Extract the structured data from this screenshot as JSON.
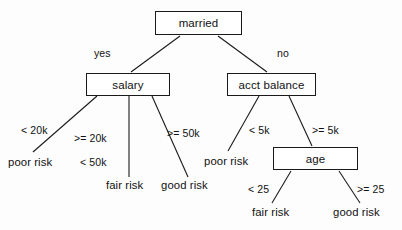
{
  "diagram": {
    "type": "decision-tree",
    "title": "",
    "nodes": [
      {
        "id": "married",
        "label": "married",
        "x": 155,
        "y": 11,
        "w": 87,
        "h": 24
      },
      {
        "id": "salary",
        "label": "salary",
        "x": 86,
        "y": 73,
        "w": 84,
        "h": 23
      },
      {
        "id": "acct_balance",
        "label": "acct balance",
        "x": 227,
        "y": 73,
        "w": 89,
        "h": 23
      },
      {
        "id": "age",
        "label": "age",
        "x": 273,
        "y": 147,
        "w": 85,
        "h": 23
      }
    ],
    "leaves": [
      {
        "id": "leaf-poor-risk-salary",
        "label": "poor risk",
        "x": 8,
        "y": 156
      },
      {
        "id": "leaf-fair-risk-salary",
        "label": "fair risk",
        "x": 106,
        "y": 179
      },
      {
        "id": "leaf-good-risk-salary",
        "label": "good risk",
        "x": 161,
        "y": 179
      },
      {
        "id": "leaf-poor-risk-acct",
        "label": "poor risk",
        "x": 204,
        "y": 155
      },
      {
        "id": "leaf-fair-risk-age",
        "label": "fair risk",
        "x": 252,
        "y": 206
      },
      {
        "id": "leaf-good-risk-age",
        "label": "good risk",
        "x": 333,
        "y": 206
      }
    ],
    "edge_labels": [
      {
        "id": "edge-label-yes",
        "label": "yes",
        "x": 94,
        "y": 47
      },
      {
        "id": "edge-label-no",
        "label": "no",
        "x": 277,
        "y": 47
      },
      {
        "id": "edge-label-lt-20k",
        "label": "< 20k",
        "x": 21,
        "y": 124
      },
      {
        "id": "edge-label-gte-20k",
        "label": ">= 20k",
        "x": 74,
        "y": 132
      },
      {
        "id": "edge-label-lt-50k",
        "label": "< 50k",
        "x": 80,
        "y": 156
      },
      {
        "id": "edge-label-gte-50k",
        "label": ">= 50k",
        "x": 167,
        "y": 127
      },
      {
        "id": "edge-label-lt-5k",
        "label": "< 5k",
        "x": 249,
        "y": 124
      },
      {
        "id": "edge-label-gte-5k",
        "label": ">= 5k",
        "x": 312,
        "y": 124
      },
      {
        "id": "edge-label-lt-25",
        "label": "< 25",
        "x": 248,
        "y": 183
      },
      {
        "id": "edge-label-gte-25",
        "label": ">= 25",
        "x": 357,
        "y": 183
      }
    ],
    "edges": [
      {
        "id": "edge-married-salary",
        "from": "married",
        "to": "salary",
        "condition": "yes",
        "x1": 180,
        "y1": 36,
        "x2": 131,
        "y2": 72
      },
      {
        "id": "edge-married-acct",
        "from": "married",
        "to": "acct_balance",
        "condition": "no",
        "x1": 218,
        "y1": 36,
        "x2": 267,
        "y2": 72
      },
      {
        "id": "edge-salary-poor",
        "from": "salary",
        "to": "leaf-poor-risk-salary",
        "condition": "< 20k",
        "x1": 97,
        "y1": 96,
        "x2": 33,
        "y2": 152
      },
      {
        "id": "edge-salary-fair",
        "from": "salary",
        "to": "leaf-fair-risk-salary",
        "condition": ">= 20k, < 50k",
        "x1": 129,
        "y1": 96,
        "x2": 129,
        "y2": 177
      },
      {
        "id": "edge-salary-good",
        "from": "salary",
        "to": "leaf-good-risk-salary",
        "condition": ">= 50k",
        "x1": 152,
        "y1": 96,
        "x2": 188,
        "y2": 177
      },
      {
        "id": "edge-acct-poor",
        "from": "acct_balance",
        "to": "leaf-poor-risk-acct",
        "condition": "< 5k",
        "x1": 259,
        "y1": 96,
        "x2": 228,
        "y2": 151
      },
      {
        "id": "edge-acct-age",
        "from": "acct_balance",
        "to": "age",
        "condition": ">= 5k",
        "x1": 289,
        "y1": 96,
        "x2": 312,
        "y2": 146
      },
      {
        "id": "edge-age-fair",
        "from": "age",
        "to": "leaf-fair-risk-age",
        "condition": "< 25",
        "x1": 291,
        "y1": 171,
        "x2": 272,
        "y2": 203
      },
      {
        "id": "edge-age-good",
        "from": "age",
        "to": "leaf-good-risk-age",
        "condition": ">= 25",
        "x1": 339,
        "y1": 171,
        "x2": 360,
        "y2": 203
      }
    ],
    "colors": {
      "stroke": "#1a1a1a",
      "text": "#111111",
      "background": "#fdfdfd",
      "node_fill": "#ffffff"
    }
  }
}
